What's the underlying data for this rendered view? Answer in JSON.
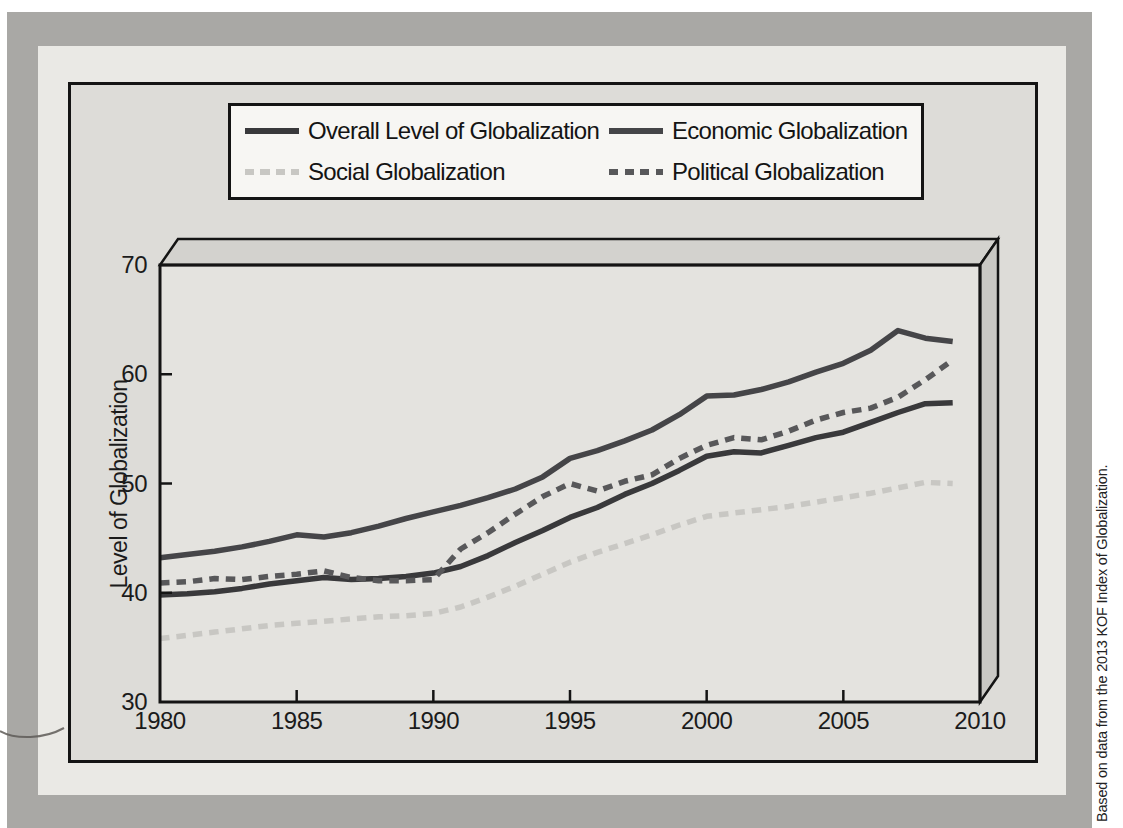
{
  "figure": {
    "source_note": "Based on data from the 2013 KOF Index of Globalization."
  },
  "chart_data": {
    "type": "line",
    "x": [
      1980,
      1981,
      1982,
      1983,
      1984,
      1985,
      1986,
      1987,
      1988,
      1989,
      1990,
      1991,
      1992,
      1993,
      1994,
      1995,
      1996,
      1997,
      1998,
      1999,
      2000,
      2001,
      2002,
      2003,
      2004,
      2005,
      2006,
      2007,
      2008,
      2009
    ],
    "series": [
      {
        "name": "Overall Level of Globalization",
        "line_style": "solid",
        "color": "#39393b",
        "values": [
          39.8,
          39.9,
          40.1,
          40.4,
          40.8,
          41.1,
          41.4,
          41.2,
          41.3,
          41.5,
          41.8,
          42.4,
          43.4,
          44.6,
          45.7,
          46.9,
          47.8,
          49.0,
          50.0,
          51.2,
          52.5,
          52.9,
          52.8,
          53.5,
          54.2,
          54.7,
          55.6,
          56.5,
          57.3,
          57.4
        ]
      },
      {
        "name": "Economic Globalization",
        "line_style": "solid",
        "color": "#454548",
        "values": [
          43.2,
          43.5,
          43.8,
          44.2,
          44.7,
          45.3,
          45.1,
          45.5,
          46.1,
          46.8,
          47.4,
          48.0,
          48.7,
          49.5,
          50.6,
          52.3,
          53.0,
          53.9,
          54.9,
          56.3,
          58.0,
          58.1,
          58.6,
          59.3,
          60.2,
          61.0,
          62.2,
          64.0,
          63.3,
          63.0
        ]
      },
      {
        "name": "Social Globalization",
        "line_style": "dashed",
        "color": "#c8c7c3",
        "values": [
          35.8,
          36.1,
          36.4,
          36.7,
          37.0,
          37.2,
          37.4,
          37.6,
          37.8,
          37.9,
          38.1,
          38.7,
          39.6,
          40.6,
          41.7,
          42.8,
          43.7,
          44.5,
          45.3,
          46.2,
          47.0,
          47.3,
          47.6,
          47.9,
          48.3,
          48.7,
          49.1,
          49.6,
          50.1,
          50.0
        ]
      },
      {
        "name": "Political Globalization",
        "line_style": "dashed",
        "color": "#58585a",
        "values": [
          40.9,
          41.0,
          41.3,
          41.2,
          41.5,
          41.7,
          42.0,
          41.4,
          41.1,
          41.1,
          41.2,
          44.0,
          45.5,
          47.2,
          48.8,
          50.0,
          49.3,
          50.2,
          50.8,
          52.3,
          53.5,
          54.2,
          54.0,
          54.8,
          55.8,
          56.5,
          56.9,
          57.9,
          59.5,
          61.3
        ]
      }
    ],
    "title": "",
    "xlabel": "",
    "ylabel": "Level of Globalization",
    "xticks": [
      1980,
      1985,
      1990,
      1995,
      2000,
      2005,
      2010
    ],
    "yticks": [
      30,
      40,
      50,
      60,
      70
    ],
    "xlim": [
      1980,
      2010
    ],
    "ylim": [
      30,
      70
    ],
    "grid": false,
    "legend_position": "top-center"
  }
}
